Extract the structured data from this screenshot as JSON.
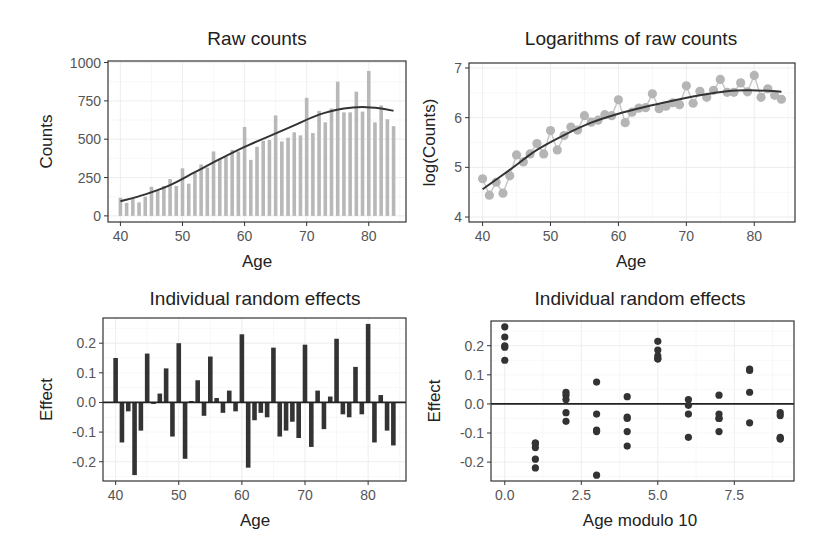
{
  "chart_data": [
    {
      "type": "bar",
      "title": "Raw counts",
      "xlabel": "Age",
      "ylabel": "Counts",
      "xlim": [
        38,
        86
      ],
      "ylim": [
        -40,
        1010
      ],
      "xticks": [
        40,
        50,
        60,
        70,
        80
      ],
      "yticks": [
        0,
        250,
        500,
        750,
        1000
      ],
      "grid": true,
      "bar_color": "#b8b8b8",
      "smooth_color": "#333333",
      "x": [
        40,
        41,
        42,
        43,
        44,
        45,
        46,
        47,
        48,
        49,
        50,
        51,
        52,
        53,
        54,
        55,
        56,
        57,
        58,
        59,
        60,
        61,
        62,
        63,
        64,
        65,
        66,
        67,
        68,
        69,
        70,
        71,
        72,
        73,
        74,
        75,
        76,
        77,
        78,
        79,
        80,
        81,
        82,
        83,
        84
      ],
      "values": [
        118,
        85,
        110,
        88,
        125,
        190,
        165,
        195,
        240,
        195,
        310,
        210,
        280,
        335,
        315,
        420,
        370,
        385,
        430,
        420,
        580,
        365,
        450,
        490,
        495,
        655,
        485,
        510,
        545,
        525,
        770,
        540,
        685,
        610,
        700,
        875,
        675,
        675,
        810,
        680,
        945,
        610,
        720,
        630,
        585
      ],
      "smooth": {
        "x": [
          40,
          44,
          48,
          52,
          56,
          60,
          64,
          68,
          72,
          76,
          79,
          82,
          84
        ],
        "y": [
          95,
          140,
          200,
          285,
          370,
          450,
          520,
          590,
          660,
          700,
          710,
          700,
          685
        ]
      }
    },
    {
      "type": "line",
      "title": "Logarithms of raw counts",
      "xlabel": "Age",
      "ylabel": "log(Counts)",
      "xlim": [
        38,
        86
      ],
      "ylim": [
        3.9,
        7.1
      ],
      "xticks": [
        40,
        50,
        60,
        70,
        80
      ],
      "yticks": [
        4,
        5,
        6,
        7
      ],
      "grid": true,
      "point_color": "#b5b5b5",
      "smooth_color": "#333333",
      "x": [
        40,
        41,
        42,
        43,
        44,
        45,
        46,
        47,
        48,
        49,
        50,
        51,
        52,
        53,
        54,
        55,
        56,
        57,
        58,
        59,
        60,
        61,
        62,
        63,
        64,
        65,
        66,
        67,
        68,
        69,
        70,
        71,
        72,
        73,
        74,
        75,
        76,
        77,
        78,
        79,
        80,
        81,
        82,
        83,
        84
      ],
      "values": [
        4.77,
        4.44,
        4.7,
        4.48,
        4.83,
        5.25,
        5.11,
        5.27,
        5.48,
        5.27,
        5.74,
        5.35,
        5.64,
        5.81,
        5.75,
        6.04,
        5.91,
        5.95,
        6.06,
        6.04,
        6.36,
        5.9,
        6.11,
        6.19,
        6.2,
        6.48,
        6.18,
        6.23,
        6.3,
        6.26,
        6.64,
        6.29,
        6.53,
        6.41,
        6.55,
        6.77,
        6.51,
        6.51,
        6.7,
        6.52,
        6.85,
        6.41,
        6.58,
        6.45,
        6.37
      ],
      "smooth": {
        "x": [
          40,
          44,
          48,
          52,
          56,
          60,
          64,
          68,
          72,
          76,
          79,
          82,
          84
        ],
        "y": [
          4.56,
          4.95,
          5.35,
          5.65,
          5.9,
          6.08,
          6.22,
          6.34,
          6.45,
          6.53,
          6.55,
          6.54,
          6.52
        ]
      }
    },
    {
      "type": "bar",
      "title": "Individual random effects",
      "xlabel": "Age",
      "ylabel": "Effect",
      "xlim": [
        38,
        86
      ],
      "ylim": [
        -0.265,
        0.285
      ],
      "xticks": [
        40,
        50,
        60,
        70,
        80
      ],
      "yticks": [
        -0.2,
        -0.1,
        0.0,
        0.1,
        0.2
      ],
      "ytick_labels": [
        "-0.2",
        "-0.1",
        "0.0",
        "0.1",
        "0.2"
      ],
      "grid": true,
      "bar_color": "#333333",
      "hline": 0.0,
      "x": [
        40,
        41,
        42,
        43,
        44,
        45,
        46,
        47,
        48,
        49,
        50,
        51,
        52,
        53,
        54,
        55,
        56,
        57,
        58,
        59,
        60,
        61,
        62,
        63,
        64,
        65,
        66,
        67,
        68,
        69,
        70,
        71,
        72,
        73,
        74,
        75,
        76,
        77,
        78,
        79,
        80,
        81,
        82,
        83,
        84
      ],
      "values": [
        0.15,
        -0.135,
        -0.03,
        -0.245,
        -0.095,
        0.165,
        -0.005,
        0.03,
        0.115,
        -0.115,
        0.2,
        -0.19,
        0.005,
        0.075,
        -0.045,
        0.155,
        0.015,
        -0.035,
        0.04,
        -0.03,
        0.23,
        -0.22,
        -0.06,
        -0.035,
        -0.05,
        0.185,
        -0.115,
        -0.095,
        -0.065,
        -0.12,
        0.195,
        -0.15,
        0.04,
        -0.09,
        0.02,
        0.215,
        -0.04,
        -0.05,
        0.12,
        -0.04,
        0.265,
        -0.135,
        0.025,
        -0.095,
        -0.145
      ]
    },
    {
      "type": "scatter",
      "title": "Individual random effects",
      "xlabel": "Age modulo 10",
      "ylabel": "Effect",
      "xlim": [
        -0.45,
        9.45
      ],
      "ylim": [
        -0.265,
        0.285
      ],
      "xticks": [
        0.0,
        2.5,
        5.0,
        7.5
      ],
      "xtick_labels": [
        "0.0",
        "2.5",
        "5.0",
        "7.5"
      ],
      "yticks": [
        -0.2,
        -0.1,
        0.0,
        0.1,
        0.2
      ],
      "ytick_labels": [
        "-0.2",
        "-0.1",
        "0.0",
        "0.1",
        "0.2"
      ],
      "grid": true,
      "point_color": "#333333",
      "hline": 0.0,
      "x": [
        0,
        0,
        0,
        0,
        0,
        1,
        1,
        1,
        1,
        1,
        2,
        2,
        2,
        2,
        2,
        3,
        3,
        3,
        3,
        3,
        4,
        4,
        4,
        4,
        4,
        5,
        5,
        5,
        5,
        5,
        6,
        6,
        6,
        6,
        7,
        7,
        7,
        7,
        7,
        8,
        8,
        8,
        8,
        9,
        9,
        9,
        9,
        9
      ],
      "y": [
        0.265,
        0.23,
        0.2,
        0.195,
        0.15,
        -0.135,
        -0.135,
        -0.15,
        -0.19,
        -0.22,
        0.04,
        0.03,
        0.015,
        -0.03,
        -0.06,
        0.075,
        -0.035,
        -0.09,
        -0.095,
        -0.245,
        0.025,
        -0.045,
        -0.05,
        -0.095,
        -0.145,
        0.215,
        0.185,
        0.165,
        0.155,
        0.155,
        0.015,
        -0.005,
        -0.035,
        -0.115,
        0.03,
        -0.035,
        -0.05,
        -0.05,
        -0.095,
        0.12,
        0.115,
        0.04,
        -0.065,
        -0.03,
        -0.04,
        -0.115,
        -0.12,
        -0.12
      ]
    }
  ]
}
